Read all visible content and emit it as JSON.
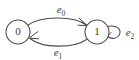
{
  "diagram": {
    "type": "state-transition-graph",
    "title": "",
    "background_color": "#ffffff",
    "stroke_color": "#4a4a4a",
    "text_color": "#3d3d3d",
    "nodes": [
      {
        "id": "n0",
        "label": "0",
        "cx": 18,
        "cy": 32,
        "r": 12
      },
      {
        "id": "n1",
        "label": "1",
        "cx": 97,
        "cy": 32,
        "r": 12
      }
    ],
    "edges": [
      {
        "id": "e0",
        "label_base": "e",
        "label_sub": "0",
        "from": "0",
        "to": "1",
        "kind": "curve-top",
        "label_x": 61,
        "label_y": 13
      },
      {
        "id": "e1",
        "label_base": "e",
        "label_sub": "1",
        "from": "1",
        "to": "0",
        "kind": "curve-bottom",
        "label_x": 58,
        "label_y": 56
      },
      {
        "id": "e2",
        "label_base": "e",
        "label_sub": "2",
        "from": "1",
        "to": "1",
        "kind": "self-loop",
        "label_x": 130,
        "label_y": 36
      }
    ]
  }
}
